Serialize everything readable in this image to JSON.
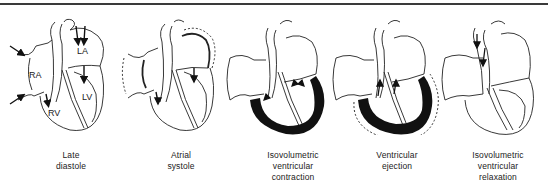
{
  "figure": {
    "stroke_color": "#222222",
    "fill_dark": "#111111",
    "rule_color": "#3a3a3a"
  },
  "chamber_labels": {
    "ra": "RA",
    "la": "LA",
    "rv": "RV",
    "lv": "LV"
  },
  "phases": [
    {
      "id": "late-diastole",
      "caption": "Late\ndiastole"
    },
    {
      "id": "atrial-systole",
      "caption": "Atrial\nsystole"
    },
    {
      "id": "isovolumetric-contraction",
      "caption": "Isovolumetric\nventricular\ncontraction"
    },
    {
      "id": "ventricular-ejection",
      "caption": "Ventricular\nejection"
    },
    {
      "id": "isovolumetric-relaxation",
      "caption": "Isovolumetric\nventricular\nrelaxation"
    }
  ]
}
